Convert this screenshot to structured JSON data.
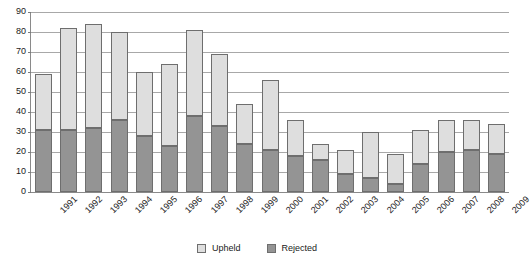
{
  "chart_data": {
    "type": "bar",
    "stacked": true,
    "title": "",
    "subtitle": "",
    "xlabel": "",
    "ylabel": "",
    "ylim": [
      0,
      90
    ],
    "ytick_step": 10,
    "yticks": [
      90,
      80,
      70,
      60,
      50,
      40,
      30,
      20,
      10,
      0
    ],
    "grid": true,
    "legend_position": "bottom-center",
    "categories": [
      "1991",
      "1992",
      "1993",
      "1994",
      "1995",
      "1996",
      "1997",
      "1998",
      "1999",
      "2000",
      "2001",
      "2002",
      "2003",
      "2004",
      "2005",
      "2006",
      "2007",
      "2008",
      "2009"
    ],
    "series": [
      {
        "name": "Rejected",
        "color": "#949494",
        "values": [
          31,
          31,
          32,
          36,
          28,
          23,
          38,
          33,
          24,
          21,
          18,
          16,
          9,
          7,
          4,
          14,
          20,
          21,
          19
        ]
      },
      {
        "name": "Upheld",
        "color": "#dedede",
        "values": [
          28,
          51,
          52,
          44,
          32,
          41,
          43,
          36,
          20,
          35,
          18,
          8,
          12,
          23,
          15,
          17,
          16,
          15,
          15
        ]
      }
    ],
    "totals": [
      59,
      82,
      84,
      80,
      60,
      64,
      81,
      69,
      44,
      56,
      36,
      24,
      21,
      30,
      19,
      31,
      36,
      36,
      34
    ]
  },
  "legend": {
    "items": [
      {
        "label": "Upheld",
        "key": "upheld"
      },
      {
        "label": "Rejected",
        "key": "rejected"
      }
    ]
  },
  "colors": {
    "upheld": "#dedede",
    "rejected": "#949494",
    "gridline": "#a8a8a8",
    "axis": "#8a8a8a",
    "text": "#1a1a1a",
    "background": "#ffffff"
  }
}
